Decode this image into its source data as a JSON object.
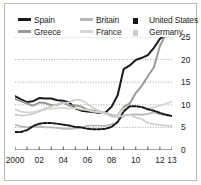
{
  "chart_data": {
    "type": "line",
    "title": "",
    "subtitle": "",
    "xlabel": "",
    "ylabel": "",
    "xlim": [
      2000,
      2013
    ],
    "ylim": [
      0,
      25
    ],
    "yticks": [
      0,
      5,
      10,
      15,
      20,
      25
    ],
    "ytick_labels": [
      "0",
      "5",
      "10",
      "15",
      "20",
      "25"
    ],
    "xticks": [
      2000,
      2001,
      2002,
      2003,
      2004,
      2005,
      2006,
      2007,
      2008,
      2009,
      2010,
      2011,
      2012,
      2013
    ],
    "xtick_labels": [
      "2000",
      "02",
      "04",
      "06",
      "08",
      "10",
      "12",
      "13"
    ],
    "xtick_label_values": [
      2000,
      2002,
      2004,
      2006,
      2008,
      2010,
      2012,
      2013
    ],
    "grid": "horizontal-dotted",
    "legend_position": "top",
    "x": [
      2000,
      2000.5,
      2001,
      2001.5,
      2002,
      2002.5,
      2003,
      2003.5,
      2004,
      2004.5,
      2005,
      2005.5,
      2006,
      2006.5,
      2007,
      2007.5,
      2008,
      2008.5,
      2009,
      2009.5,
      2010,
      2010.5,
      2011,
      2011.5,
      2012,
      2012.5,
      2013
    ],
    "series": [
      {
        "name": "Spain",
        "color": "#1a1a1a",
        "style": "solid",
        "width": 2.0,
        "values": [
          11.9,
          11.2,
          10.6,
          10.8,
          11.5,
          11.4,
          11.4,
          11.0,
          10.9,
          10.5,
          9.2,
          8.7,
          8.5,
          8.4,
          8.2,
          8.3,
          9.6,
          12.1,
          17.9,
          18.7,
          19.9,
          20.4,
          21.0,
          22.6,
          24.6,
          25.5,
          26.2
        ]
      },
      {
        "name": "Greece",
        "color": "#9a9a96",
        "style": "solid",
        "width": 2.0,
        "values": [
          11.3,
          10.8,
          10.3,
          9.8,
          10.5,
          10.4,
          9.9,
          10.0,
          10.5,
          9.8,
          9.9,
          9.6,
          8.9,
          8.7,
          8.3,
          8.1,
          7.7,
          7.6,
          9.5,
          10.3,
          12.6,
          14.2,
          16.3,
          18.3,
          23.0,
          25.6,
          27.0
        ]
      },
      {
        "name": "Britain",
        "color": "#b8b8b4",
        "style": "solid",
        "width": 1.8,
        "values": [
          5.6,
          5.2,
          5.0,
          5.1,
          5.2,
          5.0,
          5.0,
          4.9,
          4.7,
          4.7,
          4.8,
          4.9,
          5.4,
          5.4,
          5.4,
          5.3,
          5.7,
          6.2,
          7.6,
          7.8,
          7.9,
          7.8,
          8.0,
          8.3,
          7.9,
          7.7,
          7.6
        ]
      },
      {
        "name": "France",
        "color": "#d6d6d2",
        "style": "solid",
        "width": 1.8,
        "values": [
          9.0,
          8.5,
          8.3,
          8.4,
          8.7,
          9.0,
          9.1,
          9.3,
          9.3,
          9.2,
          9.3,
          9.0,
          8.8,
          8.5,
          8.4,
          8.0,
          7.4,
          7.6,
          9.1,
          9.5,
          9.7,
          9.6,
          9.2,
          9.4,
          9.8,
          10.2,
          10.7
        ]
      },
      {
        "name": "United States",
        "color": "#1a1a1a",
        "style": "dashed",
        "width": 2.0,
        "values": [
          4.0,
          4.0,
          4.4,
          5.3,
          5.8,
          6.0,
          6.0,
          5.8,
          5.6,
          5.4,
          5.1,
          5.0,
          4.7,
          4.6,
          4.6,
          4.7,
          5.1,
          6.2,
          8.5,
          9.7,
          9.7,
          9.5,
          9.0,
          8.7,
          8.2,
          7.8,
          7.5
        ]
      },
      {
        "name": "Germany",
        "color": "#cdcdc9",
        "style": "dashed",
        "width": 1.8,
        "values": [
          7.8,
          7.6,
          7.7,
          8.0,
          8.5,
          9.2,
          9.6,
          10.2,
          10.4,
          10.6,
          11.1,
          11.0,
          10.2,
          9.3,
          8.6,
          8.2,
          7.4,
          7.2,
          7.7,
          7.8,
          7.2,
          6.8,
          6.0,
          5.7,
          5.5,
          5.4,
          5.3
        ]
      }
    ]
  },
  "legend": {
    "rows": [
      [
        {
          "label": "Spain",
          "color": "#1a1a1a",
          "style": "solid"
        },
        {
          "label": "Britain",
          "color": "#b8b8b4",
          "style": "solid"
        },
        {
          "label": "United States",
          "color": "#1a1a1a",
          "style": "dashed"
        }
      ],
      [
        {
          "label": "Greece",
          "color": "#9a9a96",
          "style": "solid"
        },
        {
          "label": "France",
          "color": "#d6d6d2",
          "style": "solid"
        },
        {
          "label": "Germany",
          "color": "#cdcdc9",
          "style": "dashed"
        }
      ]
    ]
  },
  "axis": {
    "y_labels": [
      "25",
      "20",
      "15",
      "10",
      "5",
      "0"
    ],
    "x_labels": [
      "2000",
      "02",
      "04",
      "06",
      "08",
      "10",
      "12",
      "13"
    ]
  }
}
